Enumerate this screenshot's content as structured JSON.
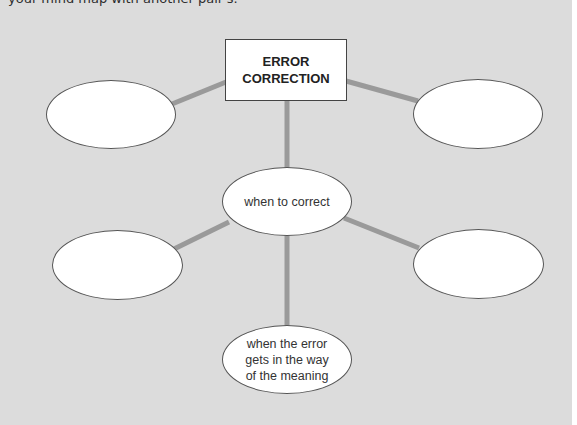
{
  "intro_text": "your mind map with another pair's.",
  "colors": {
    "panel_background": "#dcdcdc",
    "connector": "#9a9a9a",
    "node_fill": "#ffffff",
    "node_outline": "#555555"
  },
  "mind_map": {
    "central_topic": {
      "line1": "ERROR",
      "line2": "CORRECTION"
    },
    "nodes": {
      "top_left": {
        "text": ""
      },
      "top_right": {
        "text": ""
      },
      "center": {
        "text": "when to correct"
      },
      "bottom_left": {
        "text": ""
      },
      "bottom_right": {
        "text": ""
      },
      "bottom": {
        "line1": "when the error",
        "line2": "gets in the way",
        "line3": "of the meaning"
      }
    }
  }
}
